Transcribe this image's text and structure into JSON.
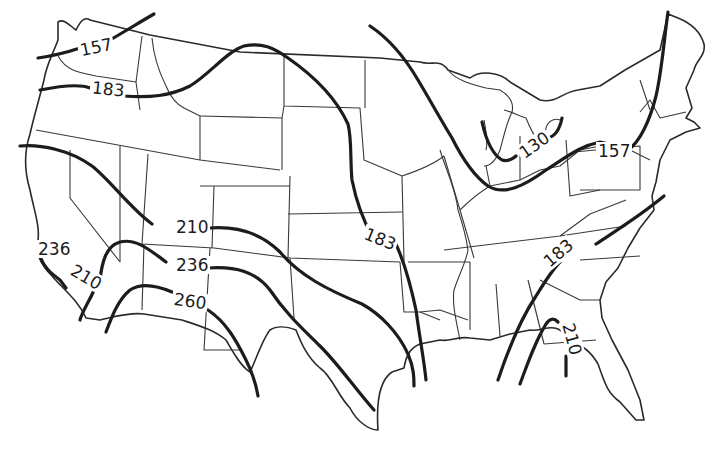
{
  "map": {
    "type": "contour-map",
    "region": "Contiguous United States",
    "description": "Isoline map of the contiguous United States with state boundaries and labeled contour lines"
  },
  "contours": [
    {
      "id": "c157-west",
      "label": "157"
    },
    {
      "id": "c183-west",
      "label": "183"
    },
    {
      "id": "c210-west",
      "label": "210"
    },
    {
      "id": "c236-southwest",
      "label": "236"
    },
    {
      "id": "c260-southwest",
      "label": "260"
    },
    {
      "id": "c236-coast",
      "label": "236"
    },
    {
      "id": "c210-coast",
      "label": "210"
    },
    {
      "id": "c183-central",
      "label": "183"
    },
    {
      "id": "c130-greatlakes",
      "label": "130"
    },
    {
      "id": "c157-northeast",
      "label": "157"
    },
    {
      "id": "c183-southeast",
      "label": "183"
    },
    {
      "id": "c210-southeast",
      "label": "210"
    }
  ],
  "colors": {
    "background": "#ffffff",
    "lines": "#1c1c1c"
  }
}
